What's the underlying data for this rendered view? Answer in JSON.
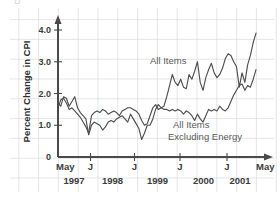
{
  "figure": {
    "background_color": "#ffffff",
    "grid_color": "#d9dbe0",
    "axis_color": "#4a4a4a",
    "partial_top_text": "D"
  },
  "axes": {
    "y_title": "Percent Change in CPI",
    "y_ticks": [
      "4.0",
      "3.0",
      "2.0",
      "1.0",
      "0"
    ],
    "y_values": [
      4.0,
      3.0,
      2.0,
      1.0,
      0
    ],
    "x_ticks": [
      "May",
      "J",
      "J",
      "J",
      "J",
      "May"
    ],
    "year_labels": [
      "1997",
      "1998",
      "1999",
      "2000",
      "2001"
    ]
  },
  "annotations": {
    "all_items": "All Items",
    "excluding_energy_line1": "All Items",
    "excluding_energy_line2": "Excluding Energy"
  },
  "chart_data": {
    "type": "line",
    "title": "",
    "xlabel": "",
    "ylabel": "Percent Change in CPI",
    "ylim": [
      0,
      4.2
    ],
    "grid": true,
    "legend_position": "inline-annotation",
    "x_tick_labels": [
      "May",
      "J",
      "J",
      "J",
      "J",
      "May"
    ],
    "x_tick_years": [
      "1997",
      "1998",
      "1999",
      "2000",
      "2001"
    ],
    "x_start": "May 1997",
    "x_end": "May 2001",
    "series": [
      {
        "name": "All Items",
        "color": "#4f4f4f",
        "values": [
          1.7,
          1.6,
          1.9,
          1.85,
          1.6,
          1.75,
          1.9,
          1.55,
          1.4,
          1.3,
          1.2,
          0.7,
          1.0,
          1.1,
          1.05,
          1.0,
          0.85,
          0.95,
          1.1,
          1.15,
          1.1,
          1.2,
          1.25,
          1.3,
          1.2,
          1.1,
          1.35,
          1.2,
          1.05,
          0.9,
          0.55,
          0.75,
          1.0,
          1.0,
          1.2,
          1.5,
          1.65,
          1.55,
          1.6,
          1.9,
          2.25,
          2.6,
          2.35,
          2.25,
          2.45,
          2.2,
          2.15,
          2.6,
          2.45,
          2.7,
          3.0,
          2.35,
          2.1,
          2.5,
          2.75,
          2.95,
          2.65,
          2.5,
          2.6,
          2.8,
          3.1,
          3.25,
          3.2,
          3.0,
          2.85,
          2.2,
          2.65,
          2.35,
          2.9,
          3.2,
          3.6,
          3.9
        ]
      },
      {
        "name": "All Items Excluding Energy",
        "color": "#4f4f4f",
        "values": [
          1.55,
          1.8,
          1.85,
          1.7,
          1.5,
          1.55,
          1.45,
          1.35,
          1.25,
          1.1,
          0.95,
          0.75,
          1.3,
          1.4,
          1.45,
          1.4,
          1.5,
          1.45,
          1.35,
          1.4,
          1.45,
          1.4,
          1.3,
          1.45,
          1.5,
          1.55,
          1.55,
          1.5,
          1.45,
          1.35,
          1.15,
          1.0,
          1.05,
          1.3,
          1.55,
          1.65,
          1.5,
          1.55,
          1.5,
          1.5,
          1.45,
          1.5,
          1.45,
          1.5,
          1.45,
          1.35,
          1.45,
          1.4,
          1.3,
          1.15,
          1.35,
          1.2,
          1.1,
          1.3,
          1.5,
          1.45,
          1.5,
          1.45,
          1.6,
          1.5,
          1.45,
          1.55,
          1.75,
          1.95,
          2.1,
          2.25,
          2.3,
          2.1,
          2.25,
          2.2,
          2.45,
          2.75
        ]
      }
    ]
  }
}
